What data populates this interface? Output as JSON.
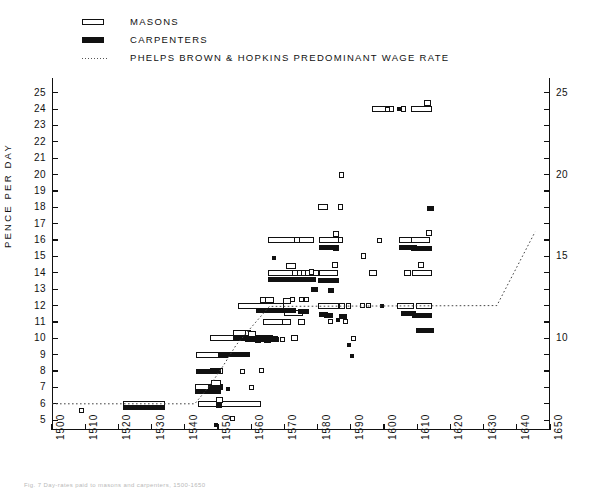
{
  "legend": {
    "items": [
      {
        "key": "open-bar-icon",
        "label": "MASONS"
      },
      {
        "key": "solid-bar-icon",
        "label": "CARPENTERS"
      },
      {
        "key": "dotted-line-icon",
        "label": "PHELPS BROWN & HOPKINS  PREDOMINANT WAGE RATE"
      }
    ]
  },
  "caption": "Fig. 7 Day-rates paid to masons and carpenters, 1500-1650",
  "chart_data": {
    "type": "scatter",
    "title": "",
    "xlabel": "",
    "ylabel": "PENCE  PER  DAY",
    "xlim": [
      1500,
      1650
    ],
    "ylim": [
      4.4,
      25.9
    ],
    "grid": false,
    "legend_position": "top-left",
    "x_ticks": [
      1500,
      1510,
      1520,
      1530,
      1540,
      1550,
      1560,
      1570,
      1580,
      1590,
      1600,
      1610,
      1620,
      1630,
      1640,
      1650
    ],
    "x_tick_labels": [
      "1500",
      "1510",
      "1520",
      "1530",
      "1540",
      "1550",
      "1560",
      "1570",
      "1580",
      "1590",
      "1600",
      "1610",
      "1620",
      "1630",
      "1640",
      "1650"
    ],
    "y_ticks_left": [
      5,
      6,
      7,
      8,
      9,
      10,
      11,
      12,
      13,
      14,
      15,
      16,
      17,
      18,
      19,
      20,
      21,
      22,
      23,
      24,
      25
    ],
    "y_tick_labels_left": [
      "5",
      "6",
      "7",
      "8",
      "9",
      "10",
      "11",
      "12",
      "13",
      "14",
      "15",
      "16",
      "17",
      "18",
      "19",
      "20",
      "21",
      "22",
      "23",
      "24",
      "25"
    ],
    "y_ticks_right": [
      10,
      15,
      20,
      25
    ],
    "y_tick_labels_right": [
      "10",
      "15",
      "20",
      "25"
    ],
    "series": [
      {
        "name": "MASONS",
        "style": "open",
        "comment": "each bar = horizontal span of years at one wage level [x_start, x_end, pence]",
        "bars": [
          [
            1521.5,
            1534.0,
            6.0
          ],
          [
            1543.5,
            1553.0,
            9.0
          ],
          [
            1543.0,
            1551.5,
            7.0
          ],
          [
            1544.0,
            1563.0,
            6.0
          ],
          [
            1547.5,
            1551.5,
            8.0
          ],
          [
            1548.0,
            1551.0,
            7.3
          ],
          [
            1549.5,
            1551.5,
            6.25
          ],
          [
            1547.5,
            1566.5,
            10.0
          ],
          [
            1554.5,
            1559.5,
            10.35
          ],
          [
            1558.2,
            1560.0,
            10.3
          ],
          [
            1559.0,
            1561.3,
            10.25
          ],
          [
            1556.0,
            1570.0,
            12.0
          ],
          [
            1562.5,
            1565.0,
            12.35
          ],
          [
            1564.3,
            1567.0,
            12.35
          ],
          [
            1569.5,
            1572.0,
            12.25
          ],
          [
            1570.0,
            1575.5,
            11.55
          ],
          [
            1563.5,
            1571.5,
            11.0
          ],
          [
            1569.2,
            1572.0,
            11.0
          ],
          [
            1574.0,
            1576.2,
            11.0
          ],
          [
            1572.0,
            1574.0,
            10.0
          ],
          [
            1565.0,
            1580.5,
            14.0
          ],
          [
            1570.5,
            1573.5,
            14.4
          ],
          [
            1572.3,
            1574.0,
            14.0
          ],
          [
            1575.0,
            1576.6,
            14.0
          ],
          [
            1577.5,
            1579.0,
            14.05
          ],
          [
            1565.0,
            1579.0,
            16.0
          ],
          [
            1573.0,
            1574.8,
            16.0
          ],
          [
            1580.5,
            1586.5,
            16.0
          ],
          [
            1584.6,
            1586.4,
            16.4
          ],
          [
            1586.0,
            1587.6,
            16.0
          ],
          [
            1580.5,
            1586.0,
            14.0
          ],
          [
            1584.2,
            1586.2,
            14.45
          ],
          [
            1580.0,
            1586.5,
            12.0
          ],
          [
            1586.3,
            1588.2,
            12.0
          ],
          [
            1588.5,
            1590.2,
            12.0
          ],
          [
            1580.0,
            1583.0,
            18.0
          ],
          [
            1586.0,
            1587.7,
            18.0
          ],
          [
            1593.0,
            1594.6,
            15.0
          ],
          [
            1595.5,
            1598.0,
            14.0
          ],
          [
            1586.3,
            1588.0,
            20.0
          ],
          [
            1596.5,
            1603.0,
            24.0
          ],
          [
            1605.0,
            1606.6,
            24.0
          ],
          [
            1608.0,
            1614.5,
            24.0
          ],
          [
            1612.0,
            1614.2,
            24.4
          ],
          [
            1604.5,
            1610.0,
            16.0
          ],
          [
            1608.0,
            1614.0,
            16.0
          ],
          [
            1612.6,
            1614.4,
            16.45
          ],
          [
            1606.0,
            1608.0,
            14.0
          ],
          [
            1608.5,
            1614.5,
            14.0
          ],
          [
            1610.2,
            1612.0,
            14.45
          ],
          [
            1604.0,
            1609.0,
            12.0
          ],
          [
            1609.5,
            1614.5,
            12.0
          ]
        ],
        "points": [
          [
            1509.0,
            5.6
          ],
          [
            1554.5,
            5.1
          ],
          [
            1560.0,
            7.0
          ],
          [
            1557.5,
            8.0
          ],
          [
            1563.0,
            8.05
          ],
          [
            1569.5,
            9.9
          ],
          [
            1572.5,
            12.4
          ],
          [
            1575.0,
            12.35
          ],
          [
            1576.8,
            12.4
          ],
          [
            1584.0,
            11.0
          ],
          [
            1588.3,
            11.0
          ],
          [
            1590.8,
            10.0
          ],
          [
            1593.5,
            12.0
          ],
          [
            1595.2,
            12.0
          ],
          [
            1598.5,
            16.0
          ],
          [
            1601.0,
            24.0
          ]
        ]
      },
      {
        "name": "CARPENTERS",
        "style": "solid",
        "bars": [
          [
            1521.5,
            1534.0,
            5.75
          ],
          [
            1543.5,
            1551.0,
            8.0
          ],
          [
            1543.0,
            1551.0,
            6.75
          ],
          [
            1547.0,
            1551.5,
            7.0
          ],
          [
            1549.5,
            1551.3,
            5.9
          ],
          [
            1550.0,
            1559.5,
            9.0
          ],
          [
            1554.5,
            1568.0,
            10.0
          ],
          [
            1558.0,
            1568.5,
            9.9
          ],
          [
            1561.0,
            1563.0,
            9.85
          ],
          [
            1564.0,
            1566.0,
            9.85
          ],
          [
            1561.5,
            1572.0,
            11.7
          ],
          [
            1564.0,
            1570.0,
            11.7
          ],
          [
            1569.5,
            1573.5,
            11.7
          ],
          [
            1574.0,
            1577.5,
            11.65
          ],
          [
            1565.0,
            1579.5,
            13.6
          ],
          [
            1571.0,
            1574.0,
            13.6
          ],
          [
            1575.0,
            1577.0,
            13.6
          ],
          [
            1578.0,
            1580.0,
            13.0
          ],
          [
            1580.5,
            1586.5,
            15.55
          ],
          [
            1584.5,
            1586.5,
            15.5
          ],
          [
            1580.0,
            1586.5,
            13.55
          ],
          [
            1580.5,
            1583.0,
            11.45
          ],
          [
            1582.0,
            1584.5,
            11.4
          ],
          [
            1586.5,
            1589.0,
            11.35
          ],
          [
            1583.0,
            1585.0,
            12.9
          ],
          [
            1604.5,
            1610.0,
            15.55
          ],
          [
            1608.0,
            1614.5,
            15.5
          ],
          [
            1605.0,
            1609.5,
            11.5
          ],
          [
            1608.5,
            1614.5,
            11.4
          ],
          [
            1609.5,
            1615.0,
            10.5
          ],
          [
            1613.0,
            1615.0,
            17.9
          ]
        ],
        "points": [
          [
            1549.5,
            4.7
          ],
          [
            1553.0,
            6.9
          ],
          [
            1567.0,
            14.9
          ],
          [
            1604.5,
            24.0
          ],
          [
            1586.0,
            11.1
          ],
          [
            1599.5,
            12.0
          ],
          [
            1589.5,
            9.6
          ],
          [
            1590.5,
            8.95
          ]
        ]
      }
    ],
    "pbh_line": {
      "name": "PHELPS BROWN & HOPKINS PREDOMINANT WAGE RATE",
      "style": "dotted",
      "points": [
        [
          1500.0,
          6.0
        ],
        [
          1543.0,
          6.0
        ],
        [
          1547.5,
          7.1
        ],
        [
          1551.5,
          8.3
        ],
        [
          1555.5,
          9.6
        ],
        [
          1561.0,
          10.9
        ],
        [
          1565.5,
          11.95
        ],
        [
          1634.0,
          12.0
        ],
        [
          1645.5,
          16.5
        ]
      ]
    }
  }
}
